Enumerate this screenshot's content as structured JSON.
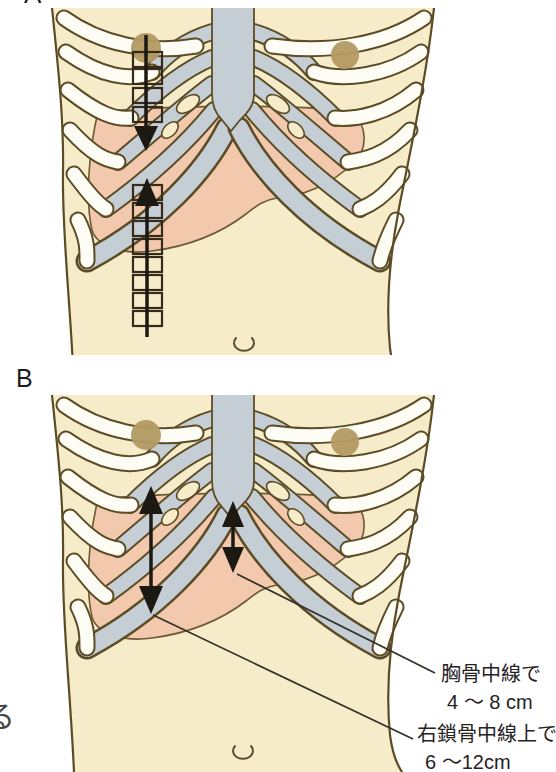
{
  "panel_a": {
    "label": "A"
  },
  "panel_b": {
    "label": "B",
    "annotations": [
      {
        "name": "胸骨中線で",
        "value": "4 〜 8 cm"
      },
      {
        "name": "右鎖骨中線上で",
        "value": "6 〜12cm"
      }
    ]
  },
  "cropped_left_text": "る",
  "colors": {
    "skin": "#f7ecca",
    "outline": "#5c4c25",
    "bone": "#fdfdf6",
    "cartilage": "#c6ced5",
    "liver": "#f3c9ad",
    "nipple": "#b39a63",
    "ink": "#1c1812",
    "leader": "#35312b",
    "text": "#2b2824",
    "page": "#ffffff"
  }
}
